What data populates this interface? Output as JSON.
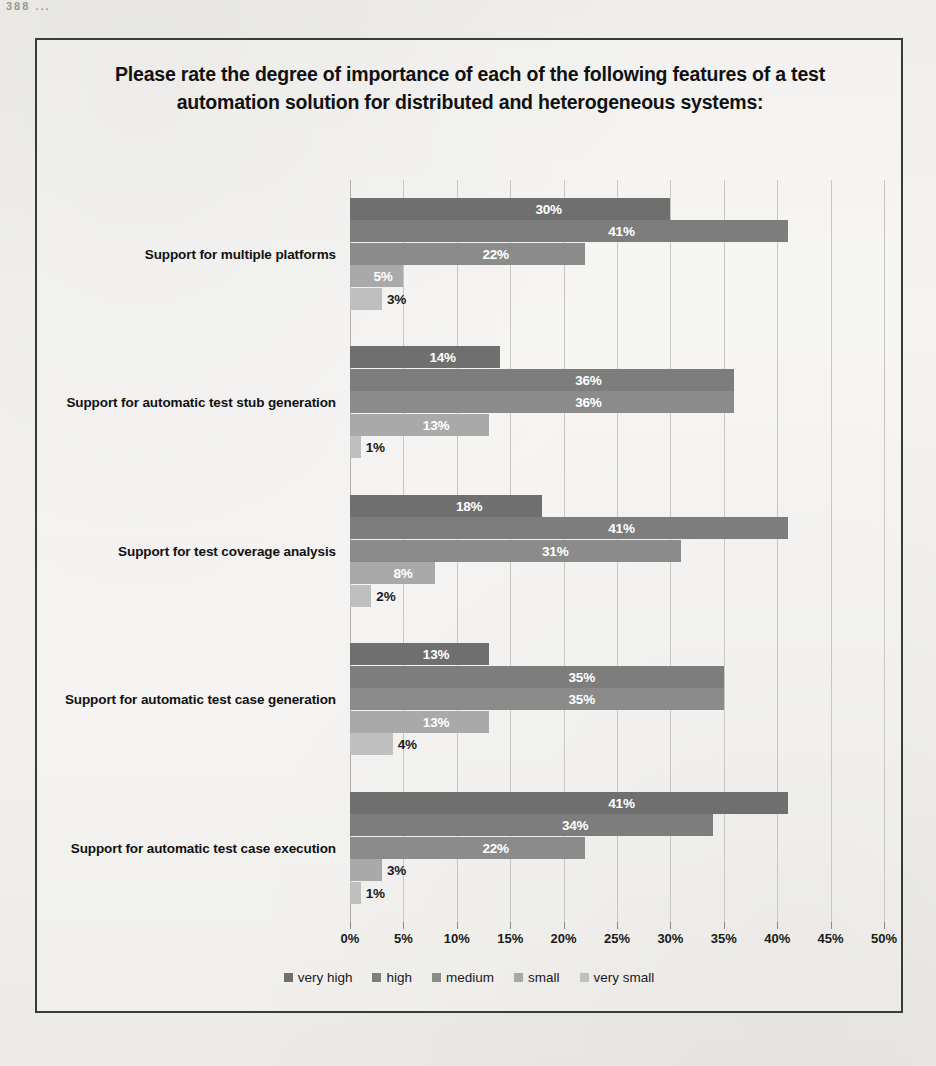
{
  "page": {
    "bleed_text": "388    ..."
  },
  "chart": {
    "title": "Please rate the degree of importance of each of the following features of a test automation solution for distributed and heterogeneous systems:"
  },
  "chart_data": {
    "type": "bar",
    "orientation": "horizontal",
    "grouped": true,
    "title": "Please rate the degree of importance of each of the following features of a test automation solution for distributed and heterogeneous systems:",
    "xlabel": "",
    "ylabel": "",
    "xlim": [
      0,
      50
    ],
    "xtick_labels": [
      "0%",
      "5%",
      "10%",
      "15%",
      "20%",
      "25%",
      "30%",
      "35%",
      "40%",
      "45%",
      "50%"
    ],
    "xticks": [
      0,
      5,
      10,
      15,
      20,
      25,
      30,
      35,
      40,
      45,
      50
    ],
    "grid": true,
    "legend_position": "bottom",
    "categories": [
      "Support for multiple platforms",
      "Support for automatic test stub generation",
      "Support for test coverage analysis",
      "Support for automatic test case generation",
      "Support for automatic test case execution"
    ],
    "series": [
      {
        "name": "very high",
        "color": "#6f6f6f",
        "values": [
          30,
          14,
          18,
          13,
          41
        ],
        "labels": [
          "30%",
          "14%",
          "18%",
          "13%",
          "41%"
        ]
      },
      {
        "name": "high",
        "color": "#7d7d7d",
        "values": [
          41,
          36,
          41,
          35,
          34
        ],
        "labels": [
          "41%",
          "36%",
          "41%",
          "35%",
          "34%"
        ]
      },
      {
        "name": "medium",
        "color": "#8b8b8b",
        "values": [
          22,
          36,
          31,
          35,
          22
        ],
        "labels": [
          "22%",
          "36%",
          "31%",
          "35%",
          "22%"
        ]
      },
      {
        "name": "small",
        "color": "#a9a9a9",
        "values": [
          5,
          13,
          8,
          13,
          3
        ],
        "labels": [
          "5%",
          "13%",
          "8%",
          "13%",
          "3%"
        ]
      },
      {
        "name": "very small",
        "color": "#bfbfbf",
        "values": [
          3,
          1,
          2,
          4,
          1
        ],
        "labels": [
          "3%",
          "1%",
          "2%",
          "4%",
          "1%"
        ]
      }
    ]
  }
}
